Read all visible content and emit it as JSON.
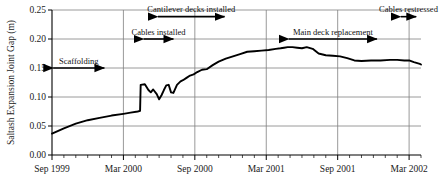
{
  "chart_data": {
    "type": "line",
    "title": "",
    "xlabel": "",
    "ylabel": "Saltash Expansion Joint Gap (m)",
    "ylim": [
      0.0,
      0.25
    ],
    "ytick_labels": [
      "0.00",
      "0.05",
      "0.10",
      "0.15",
      "0.20",
      "0.25"
    ],
    "ytick_values": [
      0.0,
      0.05,
      0.1,
      0.15,
      0.2,
      0.25
    ],
    "xtick_labels": [
      "Sep 1999",
      "Mar 2000",
      "Sep 2000",
      "Mar 2001",
      "Sep 2001",
      "Mar 2002"
    ],
    "xtick_months": [
      0,
      6,
      12,
      18,
      24,
      30
    ],
    "xlim_months": [
      0,
      31
    ],
    "minor_tick_interval_months": 1,
    "grid": "horizontal and vertical gridlines at major ticks",
    "legend": "none",
    "series": [
      {
        "name": "Saltash expansion joint gap",
        "units": "m",
        "x_months_from_sep_1999": [
          0.0,
          1.0,
          2.0,
          3.0,
          4.0,
          5.0,
          6.0,
          6.6,
          7.2,
          7.4,
          7.45,
          7.8,
          8.1,
          8.3,
          8.5,
          8.8,
          9.0,
          9.2,
          9.4,
          9.6,
          9.8,
          10.0,
          10.2,
          10.5,
          10.8,
          11.0,
          11.3,
          11.6,
          11.9,
          12.2,
          12.6,
          13.0,
          13.5,
          14.0,
          14.6,
          15.2,
          15.8,
          16.4,
          17.0,
          17.6,
          18.2,
          18.8,
          19.2,
          19.5,
          19.8,
          20.2,
          20.6,
          21.0,
          21.4,
          21.9,
          22.4,
          23.0,
          23.6,
          24.2,
          24.8,
          25.4,
          26.0,
          26.8,
          27.6,
          28.4,
          29.0,
          29.6,
          30.0,
          30.4,
          30.9,
          31.0
        ],
        "y_values_m": [
          0.037,
          0.046,
          0.054,
          0.06,
          0.064,
          0.068,
          0.071,
          0.073,
          0.075,
          0.076,
          0.121,
          0.122,
          0.112,
          0.108,
          0.113,
          0.105,
          0.096,
          0.103,
          0.112,
          0.12,
          0.121,
          0.108,
          0.107,
          0.121,
          0.127,
          0.129,
          0.133,
          0.137,
          0.139,
          0.143,
          0.147,
          0.148,
          0.155,
          0.161,
          0.166,
          0.17,
          0.174,
          0.178,
          0.179,
          0.18,
          0.181,
          0.183,
          0.184,
          0.185,
          0.186,
          0.186,
          0.185,
          0.184,
          0.186,
          0.183,
          0.175,
          0.172,
          0.171,
          0.17,
          0.167,
          0.163,
          0.162,
          0.163,
          0.163,
          0.164,
          0.164,
          0.163,
          0.163,
          0.16,
          0.157,
          0.156
        ]
      }
    ],
    "annotations": [
      {
        "label": "Scaffolding",
        "start_months": 0.1,
        "end_months": 4.4,
        "level_m": 0.15
      },
      {
        "label": "Cables installed",
        "start_months": 7.7,
        "end_months": 10.2,
        "level_m": 0.2
      },
      {
        "label": "Cantilever decks installed",
        "start_months": 8.9,
        "end_months": 14.5,
        "level_m": 0.2385
      },
      {
        "label": "Main deck replacement",
        "start_months": 19.9,
        "end_months": 27.3,
        "level_m": 0.2
      },
      {
        "label": "Cables restressed",
        "start_months": 29.3,
        "end_months": 30.6,
        "level_m": 0.2385
      }
    ],
    "colors": {
      "line": "#000000",
      "grid": "#808080",
      "axis": "#000000",
      "text": "#111111",
      "background": "#ffffff"
    }
  }
}
